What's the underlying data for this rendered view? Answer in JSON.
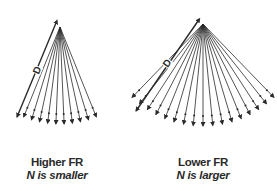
{
  "diagram": {
    "colors": {
      "line": "#2a2a2a",
      "background": "#ffffff"
    },
    "panels": [
      {
        "id": "left",
        "title": "Higher FR",
        "subtitle": "N is smaller",
        "dimension_label": "D",
        "apex": [
          60,
          27
        ],
        "ray_count": 10,
        "radius": 97,
        "angle_start_deg": 112,
        "angle_end_deg": 68,
        "d_line": {
          "from": [
            56,
            23
          ],
          "to": [
            17,
            117
          ]
        },
        "d_label_pos": [
          37,
          70
        ],
        "caption_center_x": 57
      },
      {
        "id": "right",
        "title": "Lower FR",
        "subtitle": "N is larger",
        "dimension_label": "D",
        "apex": [
          203,
          24
        ],
        "ray_count": 17,
        "radius": 102,
        "angle_start_deg": 134,
        "angle_end_deg": 46,
        "d_line": {
          "from": [
            198,
            21
          ],
          "to": [
            136,
            111
          ]
        },
        "d_label_pos": [
          167,
          63
        ],
        "caption_center_x": 203
      }
    ]
  }
}
